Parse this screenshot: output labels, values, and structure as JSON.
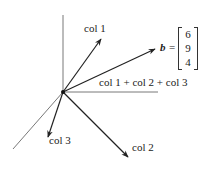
{
  "diagram": {
    "labels": {
      "col1": "col 1",
      "col2": "col 2",
      "col3": "col 3",
      "sum": "col 1 + col 2 + col 3",
      "b_symbol": "b",
      "equals": "="
    },
    "vector_b": [
      "6",
      "9",
      "4"
    ],
    "colors": {
      "axis": "#555555",
      "arrow": "#222222",
      "background": "#ffffff"
    },
    "geometry": {
      "origin": [
        63,
        92
      ],
      "axes": {
        "vertical_top": [
          63,
          15
        ],
        "horizontal_right": [
          158,
          92
        ],
        "diagonal_end": [
          13,
          149
        ]
      },
      "arrows": {
        "col1": [
          101,
          39
        ],
        "b": [
          155,
          49
        ],
        "col3": [
          48,
          137
        ],
        "col2": [
          128,
          157
        ]
      }
    }
  }
}
